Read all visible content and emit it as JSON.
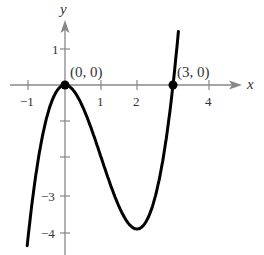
{
  "chart_data": {
    "type": "line",
    "title": "",
    "function": "f(x) = x^3 - 3x^2",
    "xlabel": "x",
    "ylabel": "y",
    "xlim": [
      -1.5,
      4.6
    ],
    "ylim": [
      -4.5,
      2.2
    ],
    "x_ticks": [
      -1,
      1,
      2,
      4
    ],
    "x_tick_labels": [
      "−1",
      "1",
      "2",
      "4"
    ],
    "y_ticks": [
      1,
      -1,
      -2,
      -3,
      -4
    ],
    "y_tick_labels": [
      "1",
      "−3",
      "−4"
    ],
    "grid": false,
    "series": [
      {
        "name": "curve",
        "x": [
          -1.05,
          -1,
          -0.5,
          0,
          0.5,
          1,
          1.5,
          2,
          2.5,
          3,
          3.15
        ],
        "y": [
          -4.46,
          -4,
          -0.875,
          0,
          -0.625,
          -2,
          -3.375,
          -4,
          -3.125,
          0,
          1.48
        ]
      }
    ],
    "points": [
      {
        "x": 0,
        "y": 0,
        "label": "(0, 0)"
      },
      {
        "x": 3,
        "y": 0,
        "label": "(3, 0)"
      }
    ]
  },
  "labels": {
    "x_axis": "x",
    "y_axis": "y",
    "tick_x_neg1": "−1",
    "tick_x_1": "1",
    "tick_x_2": "2",
    "tick_x_4": "4",
    "tick_y_1": "1",
    "tick_y_neg3": "−3",
    "tick_y_neg4": "−4",
    "point_origin": "(0, 0)",
    "point_root3": "(3, 0)"
  },
  "colors": {
    "curve": "#000000",
    "axis": "#888888",
    "text": "#333333"
  }
}
